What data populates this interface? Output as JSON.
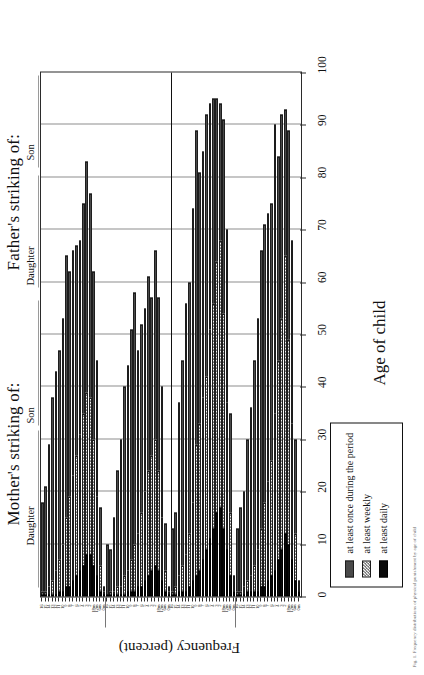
{
  "figure": {
    "panels": [
      {
        "title": "Mother's striking of:",
        "groups": [
          "Daughter",
          "Son"
        ]
      },
      {
        "title": "Father's striking of:",
        "groups": [
          "Daughter",
          "Son"
        ]
      }
    ],
    "xlabel": "Age of child",
    "ylabel": "Frequency (percent)",
    "caption": "Fig. 1. Frequency distributions of physical punishment by age of child"
  },
  "legend": {
    "items": [
      {
        "label": "at least once during the period",
        "key": "once",
        "color": "#4a4a4a"
      },
      {
        "label": "at least weekly",
        "key": "weekly",
        "color": "#f2f2f2"
      },
      {
        "label": "at least daily",
        "key": "daily",
        "color": "#0a0a0a"
      }
    ]
  },
  "chart_data": {
    "type": "bar",
    "title": "",
    "xlabel": "Age of child",
    "ylabel": "Frequency (percent)",
    "ylim": [
      0,
      100
    ],
    "ytick_labels": [
      "0",
      "10",
      "20",
      "30",
      "40",
      "50",
      "60",
      "70",
      "80",
      "90",
      "100"
    ],
    "ytick_values": [
      0,
      10,
      20,
      30,
      40,
      50,
      60,
      70,
      80,
      90,
      100
    ],
    "grid": true,
    "orientation": "horizontal",
    "legend_position": "right",
    "categories": [
      "0m",
      "6m",
      "12m",
      "18m",
      "2",
      "3",
      "4",
      "5",
      "6",
      "7",
      "8",
      "9",
      "10",
      "11",
      "12",
      "13",
      "14",
      "15",
      "16"
    ],
    "panel_groups": [
      {
        "panel": "Mother's striking of:",
        "group": "Daughter",
        "series": [
          {
            "name": "at least once during the period",
            "values": [
              3,
              30,
              68,
              89,
              93,
              92,
              84,
              90,
              75,
              73,
              71,
              66,
              53,
              45,
              36,
              30,
              20,
              17,
              13
            ]
          },
          {
            "name": "at least weekly",
            "values": [
              1,
              12,
              33,
              49,
              65,
              53,
              45,
              35,
              26,
              22,
              18,
              13,
              9,
              6,
              4,
              3,
              2,
              1,
              1
            ]
          },
          {
            "name": "at least daily",
            "values": [
              1,
              3,
              7,
              10,
              12,
              9,
              7,
              5,
              4,
              3,
              2,
              2,
              1,
              1,
              1,
              1,
              0,
              0,
              0
            ]
          }
        ]
      },
      {
        "panel": "Mother's striking of:",
        "group": "Son",
        "series": [
          {
            "name": "at least once during the period",
            "values": [
              4,
              35,
              70,
              91,
              94,
              95,
              95,
              94,
              92,
              85,
              81,
              89,
              74,
              60,
              56,
              45,
              37,
              16,
              13
            ]
          },
          {
            "name": "at least weekly",
            "values": [
              1,
              16,
              37,
              54,
              68,
              64,
              56,
              51,
              42,
              38,
              33,
              29,
              18,
              12,
              8,
              6,
              4,
              2,
              1
            ]
          },
          {
            "name": "at least daily",
            "values": [
              1,
              4,
              9,
              13,
              17,
              16,
              13,
              11,
              9,
              7,
              5,
              4,
              3,
              2,
              1,
              1,
              1,
              0,
              0
            ]
          }
        ]
      },
      {
        "panel": "Father's striking of:",
        "group": "Daughter",
        "series": [
          {
            "name": "at least once during the period",
            "values": [
              2,
              14,
              40,
              57,
              66,
              57,
              61,
              55,
              52,
              47,
              58,
              51,
              44,
              40,
              30,
              24,
              15,
              9,
              10
            ]
          },
          {
            "name": "at least weekly",
            "values": [
              1,
              5,
              15,
              24,
              30,
              27,
              24,
              20,
              16,
              12,
              10,
              7,
              5,
              4,
              2,
              2,
              1,
              1,
              0
            ]
          },
          {
            "name": "at least daily",
            "values": [
              0,
              1,
              3,
              5,
              6,
              5,
              4,
              3,
              2,
              2,
              1,
              1,
              1,
              0,
              0,
              0,
              0,
              0,
              0
            ]
          }
        ]
      },
      {
        "panel": "Father's striking of:",
        "group": "Son",
        "series": [
          {
            "name": "at least once during the period",
            "values": [
              2,
              17,
              45,
              62,
              77,
              83,
              75,
              68,
              67,
              66,
              62,
              65,
              53,
              47,
              43,
              38,
              29,
              21,
              18
            ]
          },
          {
            "name": "at least weekly",
            "values": [
              1,
              6,
              19,
              30,
              38,
              39,
              35,
              31,
              27,
              23,
              19,
              15,
              10,
              7,
              5,
              3,
              2,
              1,
              1
            ]
          },
          {
            "name": "at least daily",
            "values": [
              0,
              1,
              4,
              6,
              8,
              8,
              6,
              5,
              4,
              3,
              2,
              2,
              1,
              1,
              0,
              0,
              0,
              0,
              0
            ]
          }
        ]
      }
    ]
  }
}
